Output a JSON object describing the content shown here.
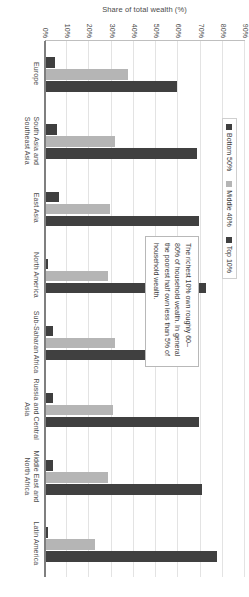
{
  "chart_data": {
    "type": "bar",
    "title": "",
    "subtitle": "",
    "xlabel": "",
    "ylabel": "Share of total wealth (%)",
    "ylim": [
      0,
      90
    ],
    "ytick_step": 10,
    "grid": true,
    "legend_position": "top-center",
    "orientation": "vertical-grouped",
    "categories": [
      "Europe",
      "South Asia and Southeast Asia",
      "East Asia",
      "North America",
      "Sub-Saharan Africa",
      "Russia and Central Asia",
      "Middle East and North Africa",
      "Latin America"
    ],
    "ytick_labels": [
      "0%",
      "10%",
      "20%",
      "30%",
      "40%",
      "50%",
      "60%",
      "70%",
      "80%",
      "90%"
    ],
    "series": [
      {
        "name": "Bottom 50%",
        "color": "#3f3f3f",
        "values": [
          4,
          5,
          6,
          1,
          3,
          3,
          3,
          1
        ]
      },
      {
        "name": "Middle 40%",
        "color": "#b5b5b5",
        "values": [
          37,
          31,
          29,
          28,
          31,
          30,
          28,
          22
        ]
      },
      {
        "name": "Top 10%",
        "color": "#404040",
        "values": [
          59,
          68,
          69,
          72,
          69,
          69,
          70,
          77
        ]
      }
    ],
    "annotations": [
      {
        "text": "The richest 10% own roughly 60–80% of household wealth. In general the poorest half own less than 5% of household wealth."
      }
    ]
  },
  "legend": {
    "items": [
      {
        "label": "Bottom 50%"
      },
      {
        "label": "Middle 40%"
      },
      {
        "label": "Top 10%"
      }
    ]
  },
  "axis": {
    "y_title": "Share of total wealth (%)"
  }
}
